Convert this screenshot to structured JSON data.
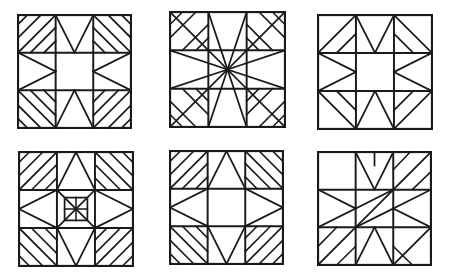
{
  "page": {
    "background_color": "#ffffff",
    "line_color": "#1a1a1a",
    "width": 449,
    "height": 279,
    "layout": "2 rows by 3 columns of square quilt blocks"
  },
  "blocks": [
    {
      "id": "block-1",
      "name": "Sawtooth Star with Striped Corners",
      "row": 1,
      "column": 1,
      "x": 17,
      "y": 14,
      "size": 111,
      "grid": "3x3",
      "center": "plain square",
      "corner_style": "parallel diagonal stripes",
      "edge_style": "sawtooth triangles"
    },
    {
      "id": "block-2",
      "name": "Radiating Star Burst",
      "row": 1,
      "column": 2,
      "x": 169,
      "y": 11,
      "size": 113,
      "grid": "3x3",
      "center": "radiating point",
      "corner_style": "parallel diagonal stripes",
      "edge_style": "rays to center"
    },
    {
      "id": "block-3",
      "name": "Sawtooth Star Open Corners",
      "row": 1,
      "column": 3,
      "x": 317,
      "y": 14,
      "size": 112,
      "grid": "3x3",
      "center": "plain square",
      "corner_style": "plain",
      "edge_style": "sawtooth triangles"
    },
    {
      "id": "block-4",
      "name": "Nested Center Star",
      "row": 2,
      "column": 1,
      "x": 18,
      "y": 151,
      "size": 112,
      "grid": "3x3",
      "center": "nested square with radiating lines",
      "corner_style": "parallel diagonal stripes",
      "edge_style": "star points"
    },
    {
      "id": "block-5",
      "name": "Diamond Star Striped Corners",
      "row": 2,
      "column": 2,
      "x": 169,
      "y": 150,
      "size": 111,
      "grid": "3x3",
      "center": "plain square",
      "corner_style": "parallel diagonal stripes",
      "edge_style": "large triangles"
    },
    {
      "id": "block-6",
      "name": "Asymmetric Pinwheel",
      "row": 2,
      "column": 3,
      "x": 317,
      "y": 151,
      "size": 111,
      "grid": "3x3",
      "center": "crossed diagonals",
      "corner_style": "mixed plain and striped",
      "edge_style": "asymmetric pinwheel arms"
    }
  ]
}
